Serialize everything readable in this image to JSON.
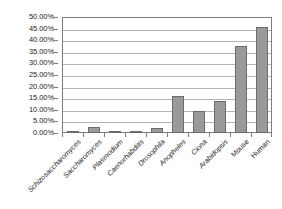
{
  "chart_data": {
    "type": "bar",
    "title": "",
    "xlabel": "",
    "ylabel": "",
    "ylim": [
      0,
      50
    ],
    "grid": true,
    "legend": false,
    "y_unit": "%",
    "y_ticks": [
      "0.00%",
      "5.00%",
      "10.00%",
      "15.00%",
      "20.00%",
      "25.00%",
      "30.00%",
      "35.00%",
      "40.00%",
      "45.00%",
      "50.00%"
    ],
    "y_tick_values": [
      0,
      5,
      10,
      15,
      20,
      25,
      30,
      35,
      40,
      45,
      50
    ],
    "categories": [
      "Schizosaccharomyces",
      "Saccharomyces",
      "Plasmodium",
      "Caenorhabditis",
      "Drosophila",
      "Anopheles",
      "Ciona",
      "Arabidopsis",
      "Mouse",
      "Human"
    ],
    "category_styles": [
      "italic",
      "italic",
      "italic",
      "italic",
      "italic",
      "italic",
      "italic",
      "italic",
      "upright",
      "upright"
    ],
    "values": [
      0.5,
      2.7,
      0.5,
      0.4,
      2.1,
      16.0,
      9.7,
      13.8,
      37.7,
      45.5
    ],
    "value_labels": [
      "0.50%",
      "2.70%",
      "0.50%",
      "0.40%",
      "2.10%",
      "16.00%",
      "9.70%",
      "13.80%",
      "37.70%",
      "45.50%"
    ],
    "bar_color": "#9a9a9a",
    "bar_border_color": "#6b6b6b",
    "gridline_color": "#b4b4b4",
    "axis_color": "#7d7d7d"
  }
}
